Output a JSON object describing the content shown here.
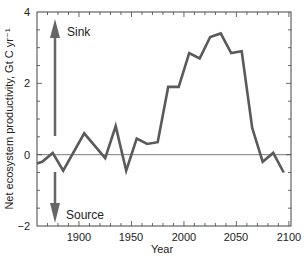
{
  "chart_data": {
    "type": "line",
    "title": "",
    "xlabel": "Year",
    "ylabel": "Net ecosystem productivity, Gt C yr⁻¹",
    "xlim": [
      1860,
      2102
    ],
    "ylim": [
      -2,
      4
    ],
    "xticks": [
      1900,
      1950,
      2000,
      2050,
      2100
    ],
    "yticks": [
      -2,
      0,
      2,
      4
    ],
    "ytick_labels": [
      "−2",
      "0",
      "2",
      "4"
    ],
    "grid": false,
    "legend": null,
    "reference_line": 0,
    "annotations": [
      {
        "text": "Sink",
        "direction": "up"
      },
      {
        "text": "Source",
        "direction": "down"
      }
    ],
    "series": [
      {
        "name": "Net ecosystem productivity",
        "color": "#5a5a5a",
        "x": [
          1858,
          1865,
          1875,
          1885,
          1905,
          1925,
          1935,
          1945,
          1955,
          1965,
          1975,
          1985,
          1995,
          2005,
          2015,
          2025,
          2035,
          2045,
          2055,
          2065,
          2075,
          2085,
          2095
        ],
        "y": [
          -0.25,
          -0.2,
          0.05,
          -0.45,
          0.6,
          -0.1,
          0.8,
          -0.45,
          0.45,
          0.3,
          0.35,
          1.9,
          1.9,
          2.85,
          2.7,
          3.3,
          3.4,
          2.85,
          2.9,
          0.75,
          -0.2,
          0.05,
          -0.5
        ]
      }
    ]
  },
  "labels": {
    "xlabel": "Year",
    "ylabel": "Net ecosystem productivity, Gt C yr⁻¹",
    "sink": "Sink",
    "source": "Source",
    "x_1900": "1900",
    "x_1950": "1950",
    "x_2000": "2000",
    "x_2050": "2050",
    "x_2100": "2100",
    "y_4": "4",
    "y_2": "2",
    "y_0": "0",
    "y_m2": "−2"
  }
}
